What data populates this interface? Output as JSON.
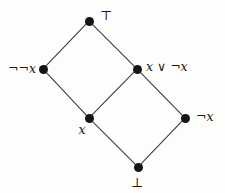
{
  "figure": {
    "kind": "hasse-diagram",
    "width": 225,
    "height": 193,
    "background_color": "#fdfdfc",
    "node_color": "#151515",
    "edge_color": "#3a3a3a"
  },
  "chart_data": {
    "type": "diagram",
    "title": "",
    "nodes": [
      {
        "id": "top",
        "label": "⊤",
        "label_style": "symbol",
        "x": 89,
        "y": 21,
        "label_x": 100,
        "label_y": 15,
        "anchor": "left"
      },
      {
        "id": "nnx",
        "label": "¬¬x",
        "label_style": "italic",
        "x": 43,
        "y": 69,
        "label_x": 36,
        "label_y": 69,
        "anchor": "right"
      },
      {
        "id": "xornotx",
        "label": "x ∨ ¬x",
        "label_style": "italic",
        "x": 137,
        "y": 69,
        "label_x": 146,
        "label_y": 67,
        "anchor": "left"
      },
      {
        "id": "x",
        "label": "x",
        "label_style": "italic",
        "x": 89,
        "y": 118,
        "label_x": 82,
        "label_y": 130,
        "anchor": "center"
      },
      {
        "id": "notx",
        "label": "¬x",
        "label_style": "italic",
        "x": 185,
        "y": 118,
        "label_x": 196,
        "label_y": 117,
        "anchor": "left"
      },
      {
        "id": "bottom",
        "label": "⊥",
        "label_style": "symbol",
        "x": 138,
        "y": 167,
        "label_x": 137,
        "label_y": 182,
        "anchor": "center"
      }
    ],
    "edges": [
      {
        "from": "top",
        "to": "nnx"
      },
      {
        "from": "top",
        "to": "xornotx"
      },
      {
        "from": "nnx",
        "to": "x"
      },
      {
        "from": "xornotx",
        "to": "x"
      },
      {
        "from": "xornotx",
        "to": "notx"
      },
      {
        "from": "x",
        "to": "bottom"
      },
      {
        "from": "notx",
        "to": "bottom"
      }
    ],
    "legend": [],
    "annotations": []
  }
}
